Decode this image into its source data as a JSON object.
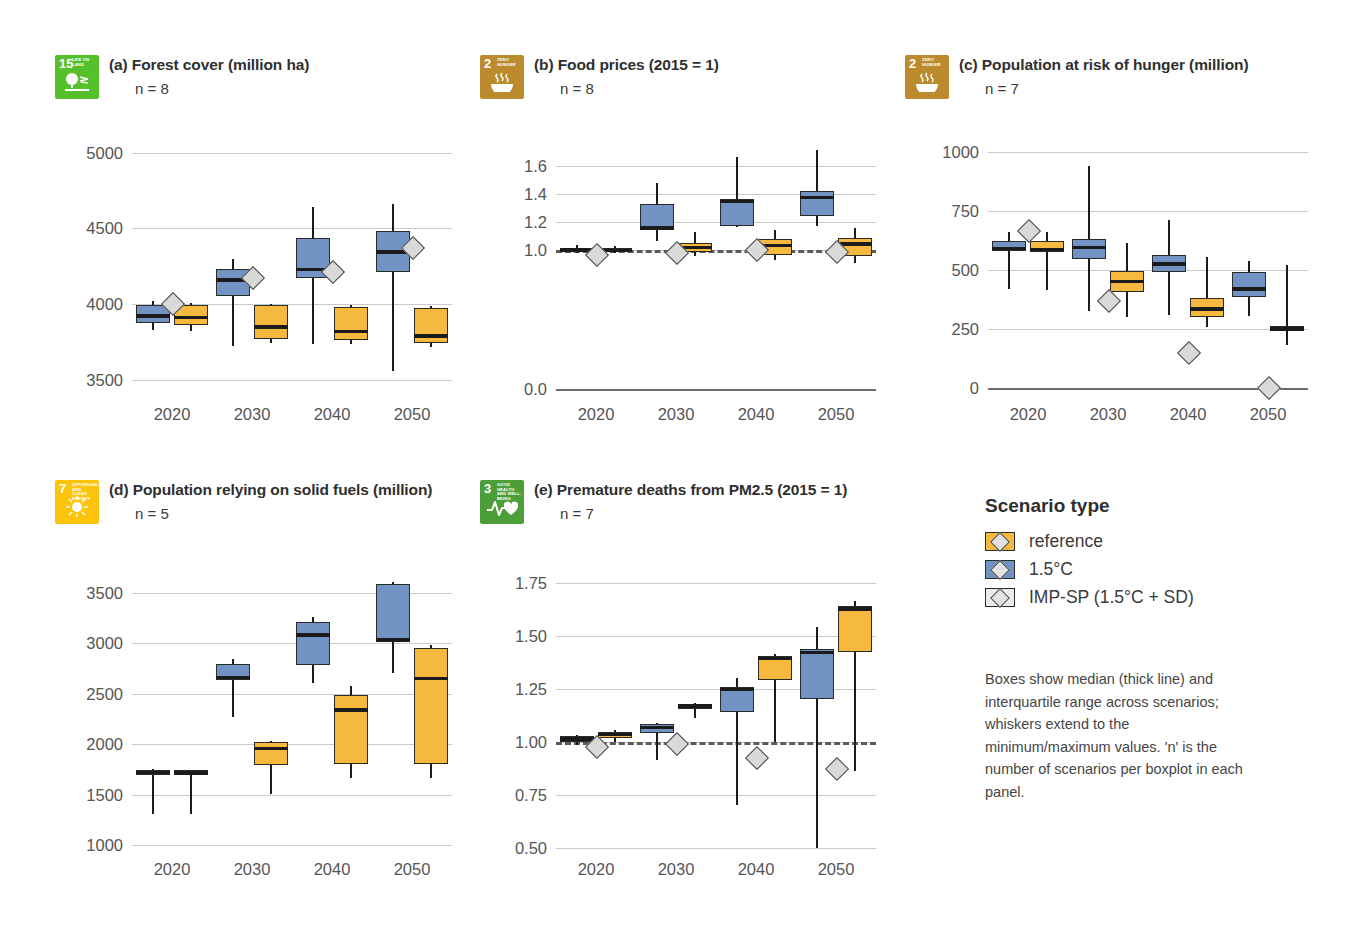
{
  "legend": {
    "title": "Scenario type",
    "items": [
      {
        "label": "reference",
        "color": "#f6b93f",
        "key": "ref"
      },
      {
        "label": "1.5°C",
        "color": "#7292c4",
        "key": "c15"
      },
      {
        "label": "IMP-SP (1.5°C + SD)",
        "color": "#ececec",
        "key": "imp"
      }
    ],
    "note": "Boxes show median (thick line) and interquartile range across scenarios; whiskers extend to the minimum/maximum values. 'n' is the number of scenarios per boxplot in each panel."
  },
  "chart_data": [
    {
      "type": "box",
      "panel": "a",
      "title": "(a) Forest cover (million ha)",
      "n_label": "n = 8",
      "sdg": {
        "number": "15",
        "name": "LIFE ON LAND",
        "color": "#56c02b",
        "glyph": "tree-icon"
      },
      "categories": [
        "2020",
        "2030",
        "2040",
        "2050"
      ],
      "ylim": [
        3400,
        5050
      ],
      "yticks": [
        5000,
        4500,
        4000,
        3500
      ],
      "ytick_labels": [
        "5000",
        "4500",
        "4000",
        "3500"
      ],
      "xlabel": "",
      "ylabel": "",
      "grid": true,
      "series": [
        {
          "name": "1.5°C",
          "color": "#7292c4",
          "boxes": [
            {
              "x": "2020",
              "min": 3830,
              "q1": 3875,
              "median": 3922,
              "q3": 3995,
              "max": 4022
            },
            {
              "x": "2030",
              "min": 3725,
              "q1": 4055,
              "median": 4160,
              "q3": 4230,
              "max": 4300
            },
            {
              "x": "2040",
              "min": 3735,
              "q1": 4175,
              "median": 4230,
              "q3": 4435,
              "max": 4640
            },
            {
              "x": "2050",
              "min": 3560,
              "q1": 4215,
              "median": 4345,
              "q3": 4480,
              "max": 4660
            }
          ]
        },
        {
          "name": "reference",
          "color": "#f6b93f",
          "boxes": [
            {
              "x": "2020",
              "min": 3820,
              "q1": 3865,
              "median": 3912,
              "q3": 3995,
              "max": 4010
            },
            {
              "x": "2030",
              "min": 3740,
              "q1": 3770,
              "median": 3850,
              "q3": 3995,
              "max": 4000
            },
            {
              "x": "2040",
              "min": 3735,
              "q1": 3760,
              "median": 3820,
              "q3": 3980,
              "max": 3995
            },
            {
              "x": "2050",
              "min": 3720,
              "q1": 3745,
              "median": 3790,
              "q3": 3975,
              "max": 3985
            }
          ]
        },
        {
          "name": "IMP-SP (1.5°C + SD)",
          "color": "#d9d9d9",
          "marker": "diamond",
          "points": [
            {
              "x": "2020",
              "value": 4000
            },
            {
              "x": "2030",
              "value": 4175
            },
            {
              "x": "2040",
              "value": 4215
            },
            {
              "x": "2050",
              "value": 4370
            }
          ]
        }
      ]
    },
    {
      "type": "box",
      "panel": "b",
      "title": "(b) Food prices (2015 = 1)",
      "n_label": "n = 8",
      "sdg": {
        "number": "2",
        "name": "ZERO HUNGER",
        "color": "#bb8b2e",
        "glyph": "bowl-icon"
      },
      "categories": [
        "2020",
        "2030",
        "2040",
        "2050"
      ],
      "ylim": [
        -0.04,
        1.75
      ],
      "yticks": [
        1.6,
        1.4,
        1.2,
        1.0,
        0.0
      ],
      "ytick_labels": [
        "1.6",
        "1.4",
        "1.2",
        "1.0",
        "0.0"
      ],
      "reference_line": 1.0,
      "xlabel": "",
      "ylabel": "",
      "grid": true,
      "series": [
        {
          "name": "1.5°C",
          "color": "#7292c4",
          "boxes": [
            {
              "x": "2020",
              "min": 0.975,
              "q1": 0.99,
              "median": 0.998,
              "q3": 1.015,
              "max": 1.035
            },
            {
              "x": "2030",
              "min": 1.065,
              "q1": 1.14,
              "median": 1.155,
              "q3": 1.325,
              "max": 1.475
            },
            {
              "x": "2040",
              "min": 1.165,
              "q1": 1.17,
              "median": 1.345,
              "q3": 1.365,
              "max": 1.665
            },
            {
              "x": "2050",
              "min": 1.17,
              "q1": 1.245,
              "median": 1.375,
              "q3": 1.42,
              "max": 1.715
            }
          ]
        },
        {
          "name": "reference",
          "color": "#f6b93f",
          "boxes": [
            {
              "x": "2020",
              "min": 0.975,
              "q1": 0.985,
              "median": 0.995,
              "q3": 1.01,
              "max": 1.03
            },
            {
              "x": "2030",
              "min": 0.955,
              "q1": 0.985,
              "median": 1.015,
              "q3": 1.045,
              "max": 1.125
            },
            {
              "x": "2040",
              "min": 0.925,
              "q1": 0.965,
              "median": 1.03,
              "q3": 1.075,
              "max": 1.14
            },
            {
              "x": "2050",
              "min": 0.905,
              "q1": 0.955,
              "median": 1.04,
              "q3": 1.085,
              "max": 1.155
            }
          ]
        },
        {
          "name": "IMP-SP (1.5°C + SD)",
          "color": "#d9d9d9",
          "marker": "diamond",
          "points": [
            {
              "x": "2020",
              "value": 0.965
            },
            {
              "x": "2030",
              "value": 0.975
            },
            {
              "x": "2040",
              "value": 1.0
            },
            {
              "x": "2050",
              "value": 0.985
            }
          ]
        }
      ]
    },
    {
      "type": "box",
      "panel": "c",
      "title": "(c) Population at risk of hunger (million)",
      "n_label": "n = 7",
      "sdg": {
        "number": "2",
        "name": "ZERO HUNGER",
        "color": "#bb8b2e",
        "glyph": "bowl-icon"
      },
      "categories": [
        "2020",
        "2030",
        "2040",
        "2050"
      ],
      "ylim": [
        -30,
        1030
      ],
      "yticks": [
        1000,
        750,
        500,
        250,
        0
      ],
      "ytick_labels": [
        "1000",
        "750",
        "500",
        "250",
        "0"
      ],
      "xlabel": "",
      "ylabel": "",
      "grid": true,
      "series": [
        {
          "name": "1.5°C",
          "color": "#7292c4",
          "boxes": [
            {
              "x": "2020",
              "min": 420,
              "q1": 580,
              "median": 592,
              "q3": 625,
              "max": 660
            },
            {
              "x": "2030",
              "min": 325,
              "q1": 545,
              "median": 595,
              "q3": 630,
              "max": 940
            },
            {
              "x": "2040",
              "min": 310,
              "q1": 490,
              "median": 525,
              "q3": 565,
              "max": 710
            },
            {
              "x": "2050",
              "min": 305,
              "q1": 385,
              "median": 420,
              "q3": 490,
              "max": 540
            }
          ]
        },
        {
          "name": "reference",
          "color": "#f6b93f",
          "boxes": [
            {
              "x": "2020",
              "min": 415,
              "q1": 578,
              "median": 588,
              "q3": 625,
              "max": 660
            },
            {
              "x": "2030",
              "min": 300,
              "q1": 405,
              "median": 450,
              "q3": 495,
              "max": 615
            },
            {
              "x": "2040",
              "min": 260,
              "q1": 300,
              "median": 335,
              "q3": 380,
              "max": 555
            },
            {
              "x": "2050",
              "min": 180,
              "q1": 240,
              "median": 250,
              "q3": 262,
              "max": 520
            }
          ]
        },
        {
          "name": "IMP-SP (1.5°C + SD)",
          "color": "#d9d9d9",
          "marker": "diamond",
          "points": [
            {
              "x": "2020",
              "value": 665
            },
            {
              "x": "2030",
              "value": 368
            },
            {
              "x": "2040",
              "value": 150
            },
            {
              "x": "2050",
              "value": 0
            }
          ]
        }
      ]
    },
    {
      "type": "box",
      "panel": "d",
      "title": "(d) Population relying on solid fuels (million)",
      "n_label": "n = 5",
      "sdg": {
        "number": "7",
        "name": "AFFORDABLE AND CLEAN ENERGY",
        "color": "#fcc30b",
        "glyph": "sun-icon"
      },
      "categories": [
        "2020",
        "2030",
        "2040",
        "2050"
      ],
      "ylim": [
        950,
        3680
      ],
      "yticks": [
        3500,
        3000,
        2500,
        2000,
        1500,
        1000
      ],
      "ytick_labels": [
        "3500",
        "3000",
        "2500",
        "2000",
        "1500",
        "1000"
      ],
      "xlabel": "",
      "ylabel": "",
      "grid": true,
      "series": [
        {
          "name": "1.5°C",
          "color": "#7292c4",
          "boxes": [
            {
              "x": "2020",
              "min": 1310,
              "q1": 1690,
              "median": 1718,
              "q3": 1745,
              "max": 1750
            },
            {
              "x": "2030",
              "min": 2270,
              "q1": 2640,
              "median": 2665,
              "q3": 2795,
              "max": 2850
            },
            {
              "x": "2040",
              "min": 2610,
              "q1": 2790,
              "median": 3085,
              "q3": 3215,
              "max": 3260
            },
            {
              "x": "2050",
              "min": 2710,
              "q1": 3010,
              "median": 3035,
              "q3": 3590,
              "max": 3610
            }
          ]
        },
        {
          "name": "reference",
          "color": "#f6b93f",
          "boxes": [
            {
              "x": "2020",
              "min": 1305,
              "q1": 1690,
              "median": 1715,
              "q3": 1742,
              "max": 1748
            },
            {
              "x": "2030",
              "min": 1510,
              "q1": 1790,
              "median": 1960,
              "q3": 2020,
              "max": 2030
            },
            {
              "x": "2040",
              "min": 1665,
              "q1": 1800,
              "median": 2340,
              "q3": 2490,
              "max": 2580
            },
            {
              "x": "2050",
              "min": 1665,
              "q1": 1805,
              "median": 2655,
              "q3": 2960,
              "max": 2990
            }
          ]
        }
      ]
    },
    {
      "type": "box",
      "panel": "e",
      "title": "(e) Premature deaths from PM2.5 (2015 = 1)",
      "n_label": "n = 7",
      "sdg": {
        "number": "3",
        "name": "GOOD HEALTH AND WELL-BEING",
        "color": "#4c9f38",
        "glyph": "heartbeat-icon"
      },
      "categories": [
        "2020",
        "2030",
        "2040",
        "2050"
      ],
      "ylim": [
        0.49,
        1.79
      ],
      "yticks": [
        1.75,
        1.5,
        1.25,
        1.0,
        0.75,
        0.5
      ],
      "ytick_labels": [
        "1.75",
        "1.50",
        "1.25",
        "1.00",
        "0.75",
        "0.50"
      ],
      "reference_line": 1.0,
      "xlabel": "",
      "ylabel": "",
      "grid": true,
      "series": [
        {
          "name": "1.5°C",
          "color": "#7292c4",
          "boxes": [
            {
              "x": "2020",
              "min": 0.985,
              "q1": 1.0,
              "median": 1.015,
              "q3": 1.03,
              "max": 1.035
            },
            {
              "x": "2030",
              "min": 0.915,
              "q1": 1.045,
              "median": 1.07,
              "q3": 1.085,
              "max": 1.09
            },
            {
              "x": "2040",
              "min": 0.705,
              "q1": 1.14,
              "median": 1.25,
              "q3": 1.26,
              "max": 1.305
            },
            {
              "x": "2050",
              "min": 0.5,
              "q1": 1.205,
              "median": 1.425,
              "q3": 1.44,
              "max": 1.545
            }
          ]
        },
        {
          "name": "reference",
          "color": "#f6b93f",
          "boxes": [
            {
              "x": "2020",
              "min": 1.0,
              "q1": 1.02,
              "median": 1.035,
              "q3": 1.05,
              "max": 1.055
            },
            {
              "x": "2030",
              "min": 1.115,
              "q1": 1.155,
              "median": 1.17,
              "q3": 1.175,
              "max": 1.185
            },
            {
              "x": "2040",
              "min": 1.0,
              "q1": 1.295,
              "median": 1.395,
              "q3": 1.405,
              "max": 1.415
            },
            {
              "x": "2050",
              "min": 0.865,
              "q1": 1.425,
              "median": 1.63,
              "q3": 1.645,
              "max": 1.665
            }
          ]
        },
        {
          "name": "IMP-SP (1.5°C + SD)",
          "color": "#d9d9d9",
          "marker": "diamond",
          "points": [
            {
              "x": "2020",
              "value": 0.975
            },
            {
              "x": "2030",
              "value": 0.99
            },
            {
              "x": "2040",
              "value": 0.925
            },
            {
              "x": "2050",
              "value": 0.875
            }
          ]
        }
      ]
    }
  ]
}
